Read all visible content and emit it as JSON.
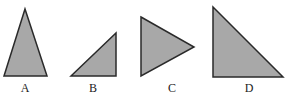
{
  "figure": {
    "fill": "#a8a8a8",
    "stroke": "#2a2a2a",
    "shapes": [
      {
        "label": "A",
        "points": "25,9 47,76 4,76",
        "lx": 25,
        "ly": 92
      },
      {
        "label": "B",
        "points": "71,76 116,33 116,76",
        "lx": 93,
        "ly": 92
      },
      {
        "label": "C",
        "points": "141,17 194,47 141,76",
        "lx": 172,
        "ly": 92
      },
      {
        "label": "D",
        "points": "213,7 213,77 283,77",
        "lx": 249,
        "ly": 92
      }
    ]
  }
}
